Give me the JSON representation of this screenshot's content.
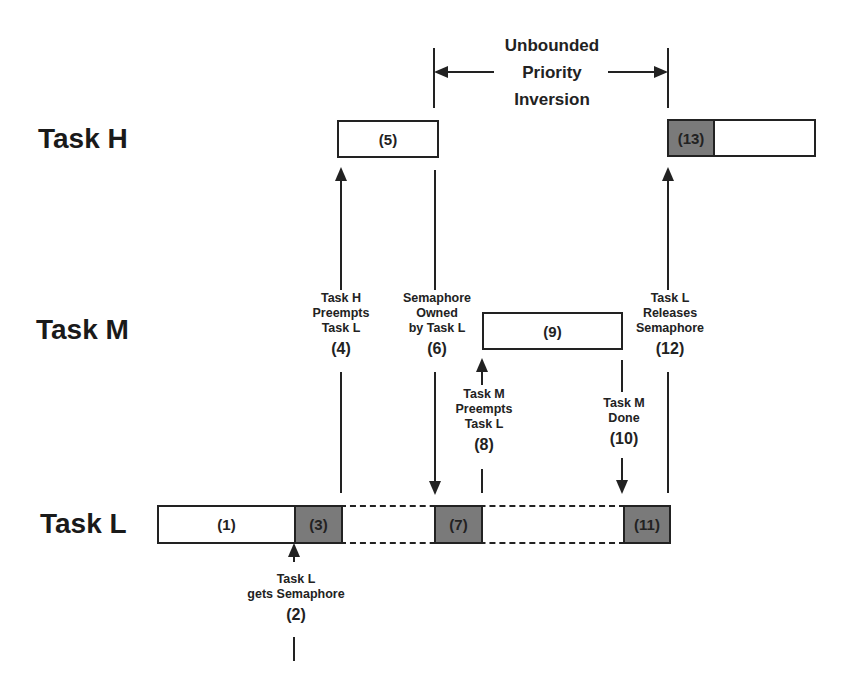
{
  "title": {
    "lines": [
      "Unbounded",
      "Priority",
      "Inversion"
    ]
  },
  "tasks": {
    "high": "Task H",
    "medium": "Task M",
    "low": "Task L"
  },
  "segments": {
    "s1": "(1)",
    "s3": "(3)",
    "s5": "(5)",
    "s7": "(7)",
    "s9": "(9)",
    "s11": "(11)",
    "s13": "(13)"
  },
  "events": {
    "e2": {
      "lines": [
        "Task L",
        "gets Semaphore"
      ],
      "num": "(2)"
    },
    "e4": {
      "lines": [
        "Task H",
        "Preempts",
        "Task L"
      ],
      "num": "(4)"
    },
    "e6": {
      "lines": [
        "Semaphore",
        "Owned",
        "by Task L"
      ],
      "num": "(6)"
    },
    "e8": {
      "lines": [
        "Task M",
        "Preempts",
        "Task L"
      ],
      "num": "(8)"
    },
    "e10": {
      "lines": [
        "Task M",
        "Done"
      ],
      "num": "(10)"
    },
    "e12": {
      "lines": [
        "Task L",
        "Releases",
        "Semaphore"
      ],
      "num": "(12)"
    }
  },
  "colors": {
    "shaded": "#7a7a7a",
    "line": "#222222",
    "background": "#ffffff"
  }
}
